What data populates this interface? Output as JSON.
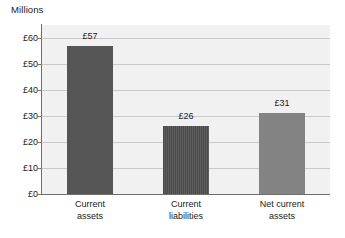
{
  "chart_data": {
    "type": "bar",
    "title": "Millions",
    "xlabel": "",
    "ylabel": "",
    "categories": [
      "Current assets",
      "Current liabilities",
      "Net current assets"
    ],
    "category_lines": [
      [
        "Current",
        "assets"
      ],
      [
        "Current",
        "liabilities"
      ],
      [
        "Net current",
        "assets"
      ]
    ],
    "values": [
      57,
      26,
      31
    ],
    "value_labels": [
      "£57",
      "£26",
      "£31"
    ],
    "ylim": [
      0,
      65
    ],
    "yticks": [
      0,
      10,
      20,
      30,
      40,
      50,
      60
    ],
    "ytick_labels": [
      "£0",
      "£10",
      "£20",
      "£30",
      "£40",
      "£50",
      "£60"
    ],
    "grid": true,
    "legend": "none",
    "bar_styles": [
      "solid-dark",
      "hatch-vertical-dark",
      "solid-mid"
    ],
    "colors": {
      "bar_current_assets": "#555555",
      "bar_current_liabilities": "#4a4a4a",
      "bar_net_current_assets": "#838383",
      "plot_background": "#f1f1f1",
      "gridline": "#c9c9c9",
      "axis_line": "#6e6e6e",
      "text": "#1a1a1a",
      "page_background": "#ffffff"
    }
  }
}
